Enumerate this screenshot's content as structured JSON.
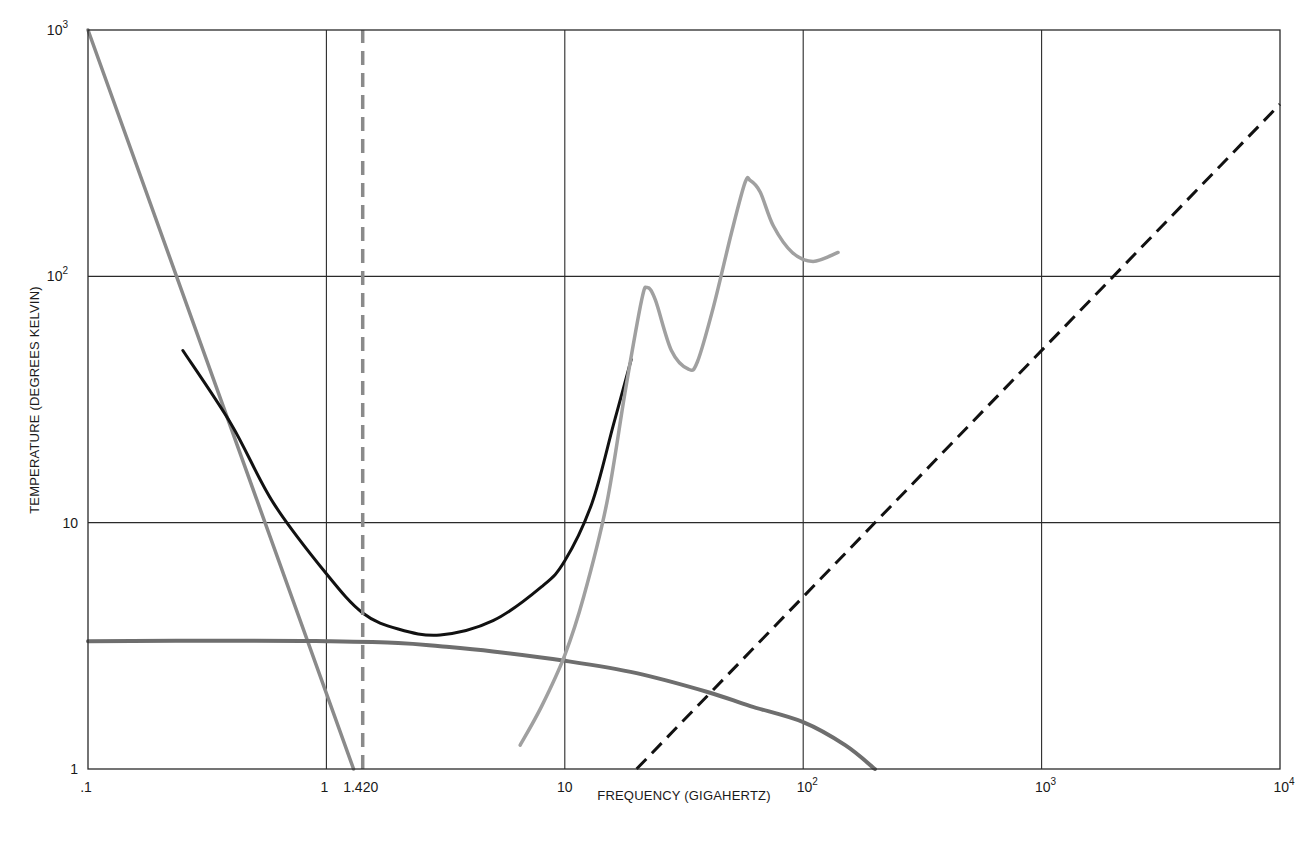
{
  "chart_data": {
    "type": "line",
    "title": "",
    "xlabel": "FREQUENCY (GIGAHERTZ)",
    "ylabel": "TEMPERATURE (DEGREES KELVIN)",
    "xscale": "log",
    "yscale": "log",
    "xlim": [
      0.1,
      10000
    ],
    "ylim": [
      1,
      1000
    ],
    "grid": true,
    "legend": "none",
    "x_ticks": [
      {
        "value": 0.1,
        "base": ".1",
        "exp": ""
      },
      {
        "value": 1,
        "base": "1",
        "exp": ""
      },
      {
        "value": 1.42,
        "base": "1.420",
        "exp": ""
      },
      {
        "value": 10,
        "base": "10",
        "exp": ""
      },
      {
        "value": 100,
        "base": "10",
        "exp": "2"
      },
      {
        "value": 1000,
        "base": "10",
        "exp": "3"
      },
      {
        "value": 10000,
        "base": "10",
        "exp": "4"
      }
    ],
    "y_ticks": [
      {
        "value": 1,
        "base": "1",
        "exp": ""
      },
      {
        "value": 10,
        "base": "10",
        "exp": ""
      },
      {
        "value": 100,
        "base": "10",
        "exp": "2"
      },
      {
        "value": 1000,
        "base": "10",
        "exp": "3"
      }
    ],
    "series": [
      {
        "name": "galactic-background",
        "style": "solid",
        "color": "#8a8a8a",
        "width": 3.5,
        "x": [
          0.1,
          1.3
        ],
        "y": [
          1000,
          1.0
        ]
      },
      {
        "name": "cosmic-background-3K",
        "style": "solid",
        "color": "#6e6e6e",
        "width": 4,
        "x": [
          0.1,
          0.5,
          1,
          2,
          3,
          5,
          10,
          20,
          40,
          60,
          100,
          150,
          200
        ],
        "y": [
          3.3,
          3.32,
          3.3,
          3.25,
          3.15,
          3.0,
          2.75,
          2.45,
          2.05,
          1.8,
          1.55,
          1.25,
          1.0
        ]
      },
      {
        "name": "total-sky-noise",
        "style": "solid",
        "color": "#111111",
        "width": 3,
        "x": [
          0.25,
          0.4,
          0.6,
          1,
          1.42,
          2,
          3,
          5,
          8,
          10,
          13,
          16,
          19
        ],
        "y": [
          50,
          25,
          12,
          6.2,
          4.3,
          3.7,
          3.5,
          4.0,
          5.5,
          7.0,
          12,
          25,
          46
        ]
      },
      {
        "name": "atmospheric-absorption",
        "style": "solid",
        "color": "#a0a0a0",
        "width": 3.5,
        "x": [
          6.5,
          8,
          10,
          12,
          15,
          18,
          21,
          22.2,
          24,
          28,
          33,
          36,
          42,
          50,
          57,
          60,
          66,
          75,
          90,
          110,
          140
        ],
        "y": [
          1.25,
          1.8,
          2.9,
          5,
          12,
          35,
          80,
          90,
          80,
          50,
          42,
          45,
          75,
          150,
          240,
          245,
          220,
          160,
          125,
          115,
          125
        ]
      },
      {
        "name": "quantum-noise-limit",
        "style": "dashed",
        "color": "#111111",
        "width": 3,
        "x": [
          20,
          10000
        ],
        "y": [
          1,
          500
        ]
      },
      {
        "name": "hydrogen-line-1420MHz",
        "style": "dashed",
        "color": "#8a8a8a",
        "width": 3.5,
        "x": [
          1.42,
          1.42
        ],
        "y": [
          1,
          1000
        ]
      }
    ]
  }
}
